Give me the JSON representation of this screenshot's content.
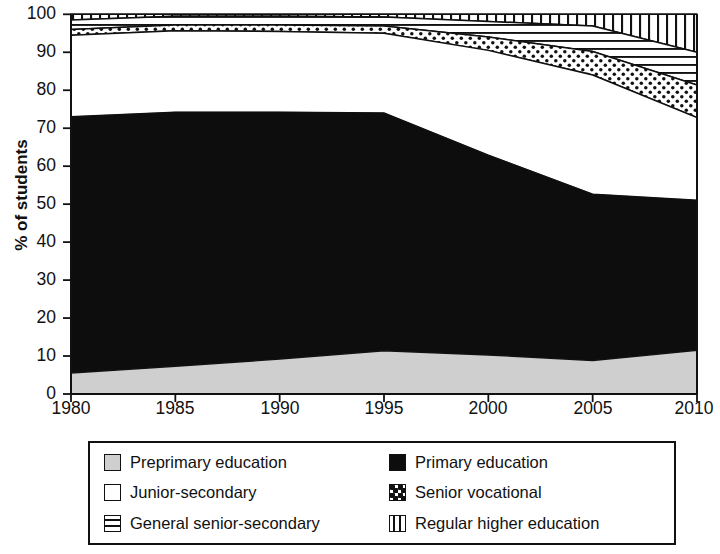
{
  "chart_data": {
    "type": "area",
    "title": "",
    "xlabel": "",
    "ylabel": "% of students",
    "xlim": [
      1980,
      2010
    ],
    "ylim": [
      0,
      100
    ],
    "grid": false,
    "stacked": true,
    "legend_position": "bottom",
    "x": [
      1980,
      1985,
      1990,
      1995,
      2000,
      2005,
      2010
    ],
    "xticklabels": [
      "1980",
      "1985",
      "1990",
      "1995",
      "2000",
      "2005",
      "2010"
    ],
    "yticklabels": [
      "0",
      "10",
      "20",
      "30",
      "40",
      "50",
      "60",
      "70",
      "80",
      "90",
      "100"
    ],
    "yticks": [
      0,
      10,
      20,
      30,
      40,
      50,
      60,
      70,
      80,
      90,
      100
    ],
    "series": [
      {
        "name": "Preprimary education",
        "pattern": "solid-grey",
        "color": "#cfcfcf",
        "values": [
          5.5,
          7.3,
          9.2,
          11.4,
          10.3,
          8.8,
          11.5
        ]
      },
      {
        "name": "Primary education",
        "pattern": "solid-black",
        "color": "#0d0d0d",
        "values": [
          67.5,
          66.9,
          65.0,
          62.6,
          52.6,
          43.8,
          39.5
        ]
      },
      {
        "name": "Junior-secondary",
        "pattern": "white",
        "color": "#ffffff",
        "values": [
          21.5,
          21.5,
          21.3,
          21.0,
          27.6,
          31.4,
          21.8
        ]
      },
      {
        "name": "Senior vocational",
        "pattern": "checker-dots",
        "color": "#ffffff",
        "values": [
          1.5,
          1.5,
          1.7,
          1.9,
          3.5,
          6.2,
          8.6
        ]
      },
      {
        "name": "General senior-secondary",
        "pattern": "horizontal-stripes",
        "color": "#ffffff",
        "values": [
          2.5,
          2.3,
          2.3,
          2.4,
          4.1,
          6.7,
          8.6
        ]
      },
      {
        "name": "Regular higher education",
        "pattern": "vertical-stripes",
        "color": "#ffffff",
        "values": [
          1.5,
          0.5,
          0.5,
          0.7,
          1.9,
          3.1,
          10.0
        ]
      }
    ],
    "cumulative_top_boundaries": {
      "preprimary": [
        5.5,
        7.3,
        9.2,
        11.4,
        10.3,
        8.8,
        11.5
      ],
      "primary": [
        73.0,
        74.2,
        74.2,
        74.0,
        62.9,
        52.6,
        51.0
      ],
      "junior_secondary": [
        94.5,
        95.7,
        95.5,
        95.0,
        90.5,
        84.0,
        72.8
      ],
      "senior_vocational": [
        96.0,
        97.2,
        97.2,
        96.9,
        94.0,
        90.2,
        81.4
      ],
      "general_senior_secondary": [
        98.5,
        99.5,
        99.5,
        99.3,
        98.1,
        96.9,
        90.0
      ],
      "regular_higher_education": [
        100,
        100,
        100,
        100,
        100,
        100,
        100
      ]
    }
  },
  "axes": {
    "y_axis_title": "% of students"
  },
  "legend": {
    "items": [
      {
        "label": "Preprimary education",
        "swatch": "solid-grey-swatch"
      },
      {
        "label": "Primary education",
        "swatch": "solid-black-swatch"
      },
      {
        "label": "Junior-secondary",
        "swatch": "white-swatch"
      },
      {
        "label": "Senior vocational",
        "swatch": "checker-dots-swatch"
      },
      {
        "label": "General senior-secondary",
        "swatch": "horizontal-stripes-swatch"
      },
      {
        "label": "Regular higher education",
        "swatch": "vertical-stripes-swatch"
      }
    ]
  }
}
